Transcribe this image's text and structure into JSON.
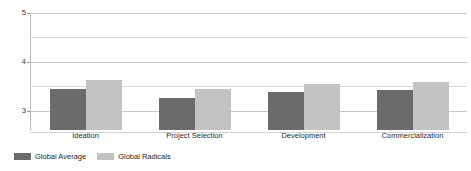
{
  "chart_data": {
    "type": "bar",
    "title": "",
    "xlabel": "",
    "ylabel": "",
    "ylim": [
      2.6,
      5.0
    ],
    "yticks": [
      3,
      4,
      5
    ],
    "ytick_labels": [
      "3",
      "4",
      "5"
    ],
    "gridlines": [
      3.0,
      3.5,
      4.0,
      4.5,
      5.0
    ],
    "grid": true,
    "legend_position": "bottom-left",
    "categories": [
      "Ideation",
      "Project Selection",
      "Development",
      "Commercialization"
    ],
    "series": [
      {
        "name": "Global Average",
        "color": "#6b6b6b",
        "values": [
          3.45,
          3.25,
          3.38,
          3.42
        ]
      },
      {
        "name": "Global Radicals",
        "color": "#c3c3c3",
        "values": [
          3.62,
          3.45,
          3.54,
          3.58
        ]
      }
    ]
  },
  "legend": {
    "items": [
      {
        "label": "Global Average"
      },
      {
        "label": "Global Radicals"
      }
    ]
  },
  "colors": {
    "series_0": "#6b6b6b",
    "series_1": "#c3c3c3",
    "gridline": "#d8d8d8",
    "axis": "#b9b9b9",
    "background": "#ffffff"
  }
}
